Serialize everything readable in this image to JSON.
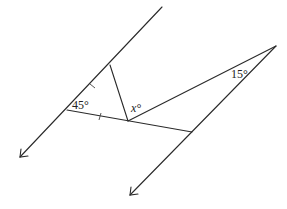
{
  "diagram": {
    "type": "geometry",
    "labels": {
      "angle_left": "45°",
      "angle_x": "x°",
      "angle_apex": "15°"
    },
    "colors": {
      "stroke": "#2a2a2a",
      "background": "#ffffff"
    },
    "points": {
      "left_line_top": [
        162,
        7
      ],
      "left_line_arrow": [
        20,
        157
      ],
      "vertex_45": [
        67,
        110
      ],
      "vertex_top": [
        110,
        65
      ],
      "vertex_x": [
        128,
        121
      ],
      "apex_15": [
        276,
        46
      ],
      "right_line_mid": [
        192,
        132
      ],
      "right_line_arrow": [
        130,
        195
      ]
    },
    "tick_marks": [
      {
        "segment": "vertex_45 to vertex_top",
        "count": 1
      },
      {
        "segment": "vertex_45 to vertex_x",
        "count": 1
      }
    ]
  }
}
